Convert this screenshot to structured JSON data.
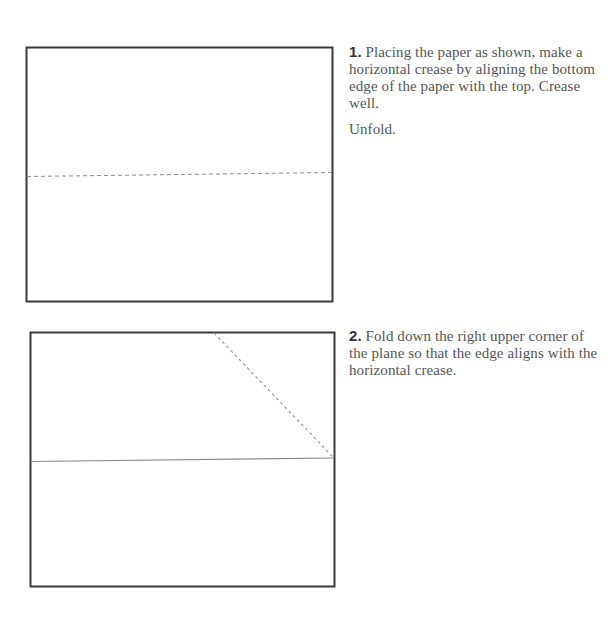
{
  "steps": [
    {
      "number": "1.",
      "text": " Placing the paper as shown, make a horizontal crease by aligning the bottom edge of the paper with the top. Crease well.",
      "followup": "Unfold.",
      "diagram": {
        "type": "rectangle-with-dashed-horizontal-crease",
        "crease_style": "dashed"
      }
    },
    {
      "number": "2.",
      "text": " Fold down the right upper corner of the plane so that the edge aligns with the horizontal crease.",
      "diagram": {
        "type": "rectangle-with-solid-crease-and-dashed-diagonal-fold",
        "crease_style": "solid",
        "fold_style": "dashed"
      }
    }
  ],
  "colors": {
    "paper_border": "#3a3a3a",
    "crease_line": "#8a8a8a",
    "text": "#555555",
    "step_number": "#333333"
  }
}
